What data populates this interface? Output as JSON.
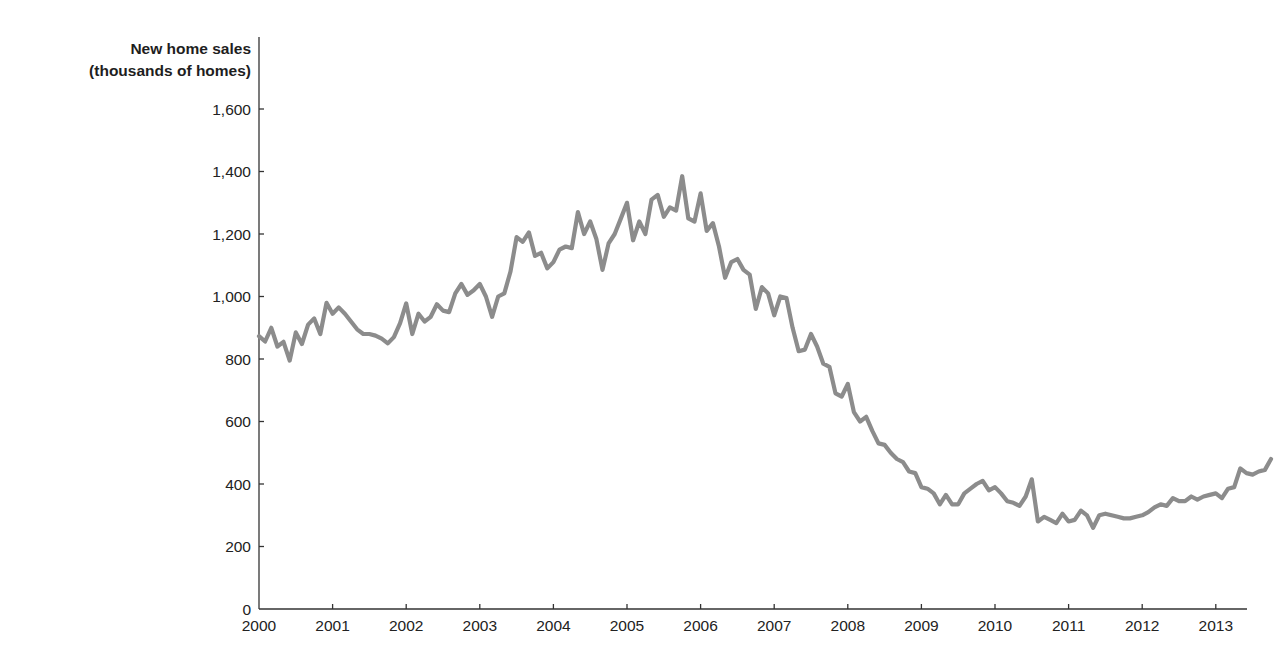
{
  "chart_data": {
    "type": "line",
    "title": "",
    "ylabel": [
      "New home sales",
      "(thousands of homes)"
    ],
    "xlabel": "",
    "ylim": [
      0,
      1600
    ],
    "xlim": [
      "2000-01",
      "2013-06"
    ],
    "grid": false,
    "legend": null,
    "yticks": [
      0,
      200,
      400,
      600,
      800,
      1000,
      1200,
      1400,
      1600
    ],
    "ytick_labels": [
      "0",
      "200",
      "400",
      "600",
      "800",
      "1,000",
      "1,200",
      "1,400",
      "1,600"
    ],
    "xtick_labels": [
      "2000",
      "2001",
      "2002",
      "2003",
      "2004",
      "2005",
      "2006",
      "2007",
      "2008",
      "2009",
      "2010",
      "2011",
      "2012",
      "2013"
    ],
    "frequency": "monthly",
    "start": "2000-01",
    "series": [
      {
        "name": "New home sales",
        "color": "#8c8c8c",
        "values": [
          873,
          856,
          900,
          840,
          855,
          795,
          885,
          848,
          910,
          930,
          880,
          980,
          945,
          965,
          945,
          920,
          895,
          880,
          880,
          875,
          865,
          850,
          870,
          915,
          978,
          880,
          945,
          920,
          935,
          975,
          955,
          950,
          1010,
          1040,
          1005,
          1020,
          1040,
          1000,
          935,
          1000,
          1010,
          1080,
          1190,
          1175,
          1205,
          1130,
          1140,
          1090,
          1110,
          1150,
          1160,
          1155,
          1270,
          1200,
          1240,
          1185,
          1085,
          1170,
          1200,
          1250,
          1300,
          1180,
          1240,
          1200,
          1310,
          1325,
          1255,
          1285,
          1275,
          1385,
          1250,
          1240,
          1330,
          1210,
          1235,
          1160,
          1060,
          1110,
          1120,
          1085,
          1070,
          960,
          1030,
          1010,
          940,
          1000,
          995,
          900,
          825,
          830,
          880,
          840,
          785,
          775,
          690,
          680,
          720,
          630,
          600,
          615,
          570,
          530,
          525,
          500,
          480,
          470,
          440,
          435,
          390,
          385,
          370,
          335,
          365,
          335,
          335,
          370,
          385,
          400,
          410,
          380,
          390,
          370,
          345,
          340,
          330,
          360,
          415,
          280,
          295,
          285,
          275,
          305,
          280,
          285,
          315,
          300,
          260,
          300,
          305,
          300,
          295,
          290,
          290,
          295,
          300,
          310,
          325,
          335,
          330,
          355,
          345,
          345,
          360,
          350,
          360,
          365,
          370,
          355,
          385,
          390,
          450,
          435,
          430,
          440,
          445,
          480
        ]
      }
    ]
  }
}
